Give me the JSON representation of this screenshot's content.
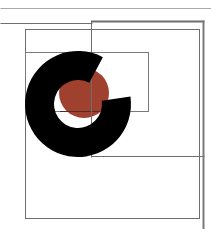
{
  "diagram": {
    "width": 211,
    "height": 229,
    "background": "#ffffff",
    "colors": {
      "line": "#6e6e6e",
      "line_light": "#9a9a9a",
      "ring": "#000000",
      "disc": "#a0402e"
    },
    "lines": [
      {
        "name": "top-rule",
        "x1": 0,
        "y1": 8,
        "x2": 211,
        "y2": 8,
        "w": 1,
        "color": "#aaaaaa"
      },
      {
        "name": "second-rule",
        "x1": 0,
        "y1": 23,
        "x2": 92,
        "y2": 23,
        "w": 1,
        "color": "#6e6e6e"
      },
      {
        "name": "right-box-top",
        "x1": 91,
        "y1": 21,
        "x2": 204,
        "y2": 21,
        "w": 2,
        "color": "#6e6e6e"
      },
      {
        "name": "right-box-left",
        "x1": 91,
        "y1": 20,
        "x2": 91,
        "y2": 157,
        "w": 1,
        "color": "#6e6e6e"
      },
      {
        "name": "right-box-bottom",
        "x1": 91,
        "y1": 156,
        "x2": 204,
        "y2": 156,
        "w": 1,
        "color": "#6e6e6e"
      },
      {
        "name": "right-box-right",
        "x1": 203,
        "y1": 20,
        "x2": 203,
        "y2": 229,
        "w": 2,
        "color": "#7a7a7a"
      }
    ],
    "rects": [
      {
        "name": "large-rect",
        "x": 25,
        "y": 29,
        "w": 174,
        "h": 189,
        "stroke": "#6e6e6e"
      },
      {
        "name": "middle-rect",
        "x": 25,
        "y": 52,
        "w": 123,
        "h": 59,
        "stroke": "#7a7a7a"
      }
    ],
    "disc": {
      "cx": 84,
      "cy": 93,
      "r": 25
    },
    "ring": {
      "cx": 78,
      "cy": 104,
      "r_outer": 53,
      "r_inner": 24,
      "gap_start_deg": -62,
      "gap_end_deg": -8
    }
  }
}
